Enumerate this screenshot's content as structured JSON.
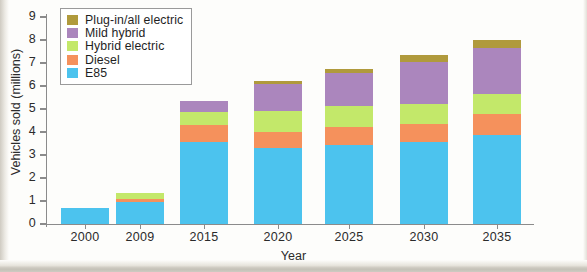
{
  "chart_data": {
    "type": "bar",
    "subtype": "stacked-bar",
    "title": "",
    "xlabel": "Year",
    "ylabel": "Vehicles sold (millions)",
    "categories": [
      "2000",
      "2009",
      "2015",
      "2020",
      "2025",
      "2030",
      "2035"
    ],
    "ylim": [
      0,
      9
    ],
    "yticks": [
      0,
      1,
      2,
      3,
      4,
      5,
      6,
      7,
      8,
      9
    ],
    "ytick_labels": [
      "0",
      "1",
      "2",
      "3",
      "4",
      "5",
      "6",
      "7",
      "8",
      "9"
    ],
    "grid": false,
    "legend_position": "top-left",
    "stack_order_bottom_to_top": [
      "E85",
      "Diesel",
      "Hybrid electric",
      "Mild hybrid",
      "Plug-in/all electric"
    ],
    "series": [
      {
        "name": "E85",
        "color": "#4cc3ee",
        "values": [
          0.7,
          0.95,
          3.55,
          3.3,
          3.45,
          3.55,
          3.85
        ]
      },
      {
        "name": "Diesel",
        "color": "#f5915c",
        "values": [
          0.0,
          0.15,
          0.75,
          0.7,
          0.75,
          0.8,
          0.95
        ]
      },
      {
        "name": "Hybrid electric",
        "color": "#c3e86a",
        "values": [
          0.0,
          0.25,
          0.55,
          0.9,
          0.95,
          0.85,
          0.85
        ]
      },
      {
        "name": "Mild hybrid",
        "color": "#ab86bd",
        "values": [
          0.0,
          0.0,
          0.5,
          1.2,
          1.4,
          1.85,
          2.0
        ]
      },
      {
        "name": "Plug-in/all electric",
        "color": "#b09a3c",
        "values": [
          0.0,
          0.0,
          0.0,
          0.1,
          0.2,
          0.3,
          0.35
        ]
      }
    ],
    "totals": [
      0.7,
      1.35,
      5.35,
      6.2,
      6.75,
      7.35,
      8.0
    ]
  },
  "legend": {
    "items": [
      {
        "label": "Plug-in/all electric",
        "color": "#b09a3c"
      },
      {
        "label": "Mild hybrid",
        "color": "#ab86bd"
      },
      {
        "label": "Hybrid electric",
        "color": "#c3e86a"
      },
      {
        "label": "Diesel",
        "color": "#f5915c"
      },
      {
        "label": "E85",
        "color": "#4cc3ee"
      }
    ]
  },
  "axes": {
    "x_title": "Year",
    "y_title": "Vehicles sold (millions)"
  }
}
